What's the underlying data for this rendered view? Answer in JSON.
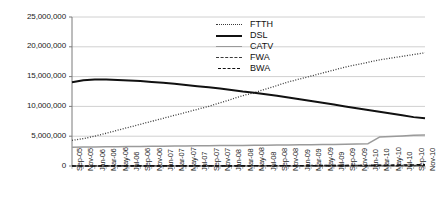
{
  "chart_data": {
    "type": "line",
    "title": "",
    "xlabel": "",
    "ylabel": "",
    "ylim": [
      0,
      25000000
    ],
    "ytick_values": [
      0,
      5000000,
      10000000,
      15000000,
      20000000,
      25000000
    ],
    "ytick_labels": [
      "0",
      "5,000,000",
      "10,000,000",
      "15,000,000",
      "20,000,000",
      "25,000,000"
    ],
    "grid": true,
    "legend_position": "top-center",
    "x": [
      "Sep-05",
      "Nov-05",
      "Jan-06",
      "Mar-06",
      "May-06",
      "Jul-06",
      "Sep-06",
      "Nov-06",
      "Jan-07",
      "Mar-07",
      "May-07",
      "Jul-07",
      "Sep-07",
      "Nov-07",
      "Jan-08",
      "Mar-08",
      "May-08",
      "Jul-08",
      "Sep-08",
      "Nov-08",
      "Jan-09",
      "Mar-09",
      "May-09",
      "Jul-09",
      "Sep-09",
      "Nov-09",
      "Jan-10",
      "Mar-10",
      "May-10",
      "Jul-10",
      "Sep-10",
      "Nov-10"
    ],
    "series": [
      {
        "name": "FTTH",
        "style": "dotted",
        "color": "#3a3a3a",
        "values": [
          4300000,
          4600000,
          5000000,
          5500000,
          6000000,
          6500000,
          7000000,
          7500000,
          8000000,
          8500000,
          9000000,
          9500000,
          10000000,
          10600000,
          11200000,
          11800000,
          12300000,
          12900000,
          13500000,
          14100000,
          14600000,
          15100000,
          15600000,
          16100000,
          16600000,
          17000000,
          17400000,
          17800000,
          18100000,
          18400000,
          18700000,
          19000000
        ]
      },
      {
        "name": "DSL",
        "style": "solid-thick",
        "color": "#111111",
        "values": [
          14050000,
          14400000,
          14500000,
          14500000,
          14450000,
          14350000,
          14250000,
          14100000,
          13950000,
          13800000,
          13600000,
          13400000,
          13200000,
          13000000,
          12750000,
          12500000,
          12300000,
          12050000,
          11800000,
          11500000,
          11200000,
          10900000,
          10600000,
          10300000,
          10000000,
          9700000,
          9400000,
          9100000,
          8800000,
          8500000,
          8200000,
          8000000
        ]
      },
      {
        "name": "CATV",
        "style": "solid-gray",
        "color": "#9a9a9a",
        "values": [
          3150000,
          3180000,
          3200000,
          3220000,
          3240000,
          3260000,
          3280000,
          3300000,
          3320000,
          3340000,
          3360000,
          3380000,
          3400000,
          3420000,
          3440000,
          3460000,
          3480000,
          3500000,
          3520000,
          3540000,
          3560000,
          3580000,
          3600000,
          3620000,
          3640000,
          3680000,
          3750000,
          4850000,
          4950000,
          5050000,
          5150000,
          5200000
        ]
      },
      {
        "name": "FWA",
        "style": "dashed-short",
        "color": "#3a3a3a",
        "values": [
          20000,
          22000,
          25000,
          27000,
          30000,
          32000,
          35000,
          37000,
          40000,
          42000,
          45000,
          47000,
          50000,
          52000,
          55000,
          57000,
          60000,
          62000,
          65000,
          67000,
          70000,
          72000,
          75000,
          77000,
          80000,
          82000,
          85000,
          87000,
          90000,
          92000,
          95000,
          100000
        ]
      },
      {
        "name": "BWA",
        "style": "dashed-long",
        "color": "#111111",
        "values": [
          10000,
          11000,
          12000,
          13000,
          14000,
          15000,
          16000,
          17000,
          18000,
          19000,
          20000,
          21000,
          22000,
          24000,
          26000,
          28000,
          30000,
          33000,
          36000,
          40000,
          45000,
          50000,
          56000,
          63000,
          70000,
          80000,
          95000,
          115000,
          135000,
          155000,
          175000,
          200000
        ]
      }
    ]
  },
  "legend": {
    "items": [
      {
        "label": "FTTH"
      },
      {
        "label": "DSL"
      },
      {
        "label": "CATV"
      },
      {
        "label": "FWA"
      },
      {
        "label": "BWA"
      }
    ]
  }
}
